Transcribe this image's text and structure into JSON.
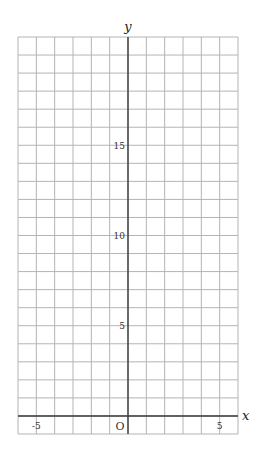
{
  "chart_data": {
    "type": "line",
    "title": "",
    "xlabel": "x",
    "ylabel": "y",
    "origin_label": "O",
    "xlim": [
      -6,
      6
    ],
    "ylim": [
      -1,
      21
    ],
    "grid": true,
    "grid_step": 1,
    "x_tick_labels": [
      {
        "value": -5,
        "label": "-5"
      },
      {
        "value": 5,
        "label": "5"
      }
    ],
    "y_tick_labels": [
      {
        "value": 5,
        "label": "5"
      },
      {
        "value": 10,
        "label": "10"
      },
      {
        "value": 15,
        "label": "15"
      }
    ],
    "series": [],
    "legend": null
  },
  "colors": {
    "grid": "#b4b4b4",
    "axis": "#3a3a3a",
    "text": "#333333",
    "background": "#ffffff"
  }
}
